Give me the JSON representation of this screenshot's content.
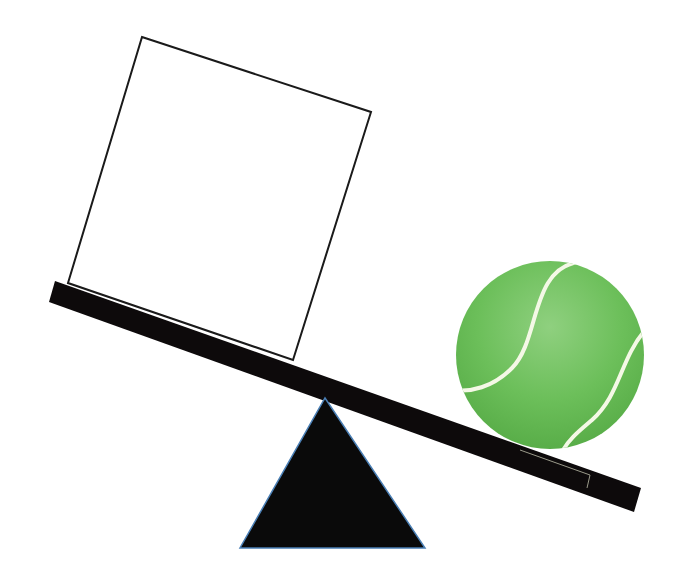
{
  "diagram": {
    "background": "#ffffff",
    "box": {
      "label": "empty box",
      "fill": "#ffffff",
      "stroke": "#1a1a1a",
      "points": "142,37 371,112 293,360 68,283"
    },
    "plank": {
      "label": "seesaw plank",
      "fill": "#0d0a0b",
      "points": "55,281 641,488 634,512 49,302"
    },
    "fulcrum": {
      "label": "fulcrum",
      "fill": "#0a0a0a",
      "stroke": "#4a7fb5",
      "points": "325,398 425,548 240,548"
    },
    "ball": {
      "label": "tennis ball",
      "cx": 550,
      "cy": 355,
      "r": 94,
      "fill": "#6cbf5a",
      "highlight": "#8fd07f",
      "shade": "#4ea33e",
      "seam": "#f4f8e6"
    }
  }
}
